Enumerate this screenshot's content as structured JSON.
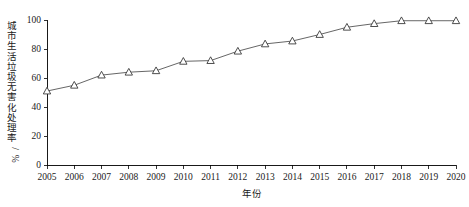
{
  "chart_data": {
    "type": "line",
    "title": "",
    "xlabel": "年份",
    "ylabel": "城市生活垃圾无害化处理率/%",
    "categories": [
      "2005",
      "2006",
      "2007",
      "2008",
      "2009",
      "2010",
      "2011",
      "2012",
      "2013",
      "2014",
      "2015",
      "2016",
      "2017",
      "2018",
      "2019",
      "2020"
    ],
    "x": [
      2005,
      2006,
      2007,
      2008,
      2009,
      2010,
      2011,
      2012,
      2013,
      2014,
      2015,
      2016,
      2017,
      2018,
      2019,
      2020
    ],
    "values": [
      51.0,
      55.0,
      62.0,
      64.0,
      65.0,
      71.5,
      72.0,
      78.5,
      83.5,
      85.5,
      90.0,
      95.0,
      97.5,
      99.5,
      99.5,
      99.5
    ],
    "series": [
      {
        "name": "城市生活垃圾无害化处理率",
        "marker": "open-triangle",
        "line_color": "#555555",
        "marker_color": "#3a3a3a",
        "values": [
          51.0,
          55.0,
          62.0,
          64.0,
          65.0,
          71.5,
          72.0,
          78.5,
          83.5,
          85.5,
          90.0,
          95.0,
          97.5,
          99.5,
          99.5,
          99.5
        ]
      }
    ],
    "ylim": [
      0,
      100
    ],
    "yticks": [
      0,
      20,
      40,
      60,
      80,
      100
    ],
    "ytick_labels": [
      "0",
      "20",
      "40",
      "60",
      "80",
      "100"
    ],
    "xtick_labels": [
      "2005",
      "2006",
      "2007",
      "2008",
      "2009",
      "2010",
      "2011",
      "2012",
      "2013",
      "2014",
      "2015",
      "2016",
      "2017",
      "2018",
      "2019",
      "2020"
    ],
    "grid": false,
    "legend": false,
    "legend_position": "none",
    "tick_direction": "out",
    "axis_color": "#000000"
  }
}
